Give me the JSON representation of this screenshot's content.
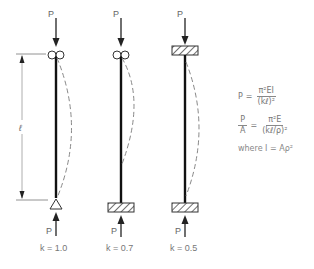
{
  "diagram": {
    "columns": [
      {
        "id": "pinned-pinned",
        "load_top": "P",
        "load_bottom": "P",
        "top_support": "roller",
        "bottom_support": "pin",
        "k_label": "k = 1.0"
      },
      {
        "id": "fixed-pinned",
        "load_top": "P",
        "load_bottom": "P",
        "top_support": "roller",
        "bottom_support": "fixed",
        "k_label": "k = 0.7"
      },
      {
        "id": "fixed-fixed",
        "load_top": "P",
        "load_bottom": "P",
        "top_support": "fixed",
        "bottom_support": "fixed",
        "k_label": "k = 0.5"
      }
    ],
    "length_label": "ℓ",
    "formulas": {
      "f1_lhs": "P",
      "f1_eq": "=",
      "f1_num": "π²EI",
      "f1_den": "(kℓ)²",
      "f2_lhs_num": "P",
      "f2_lhs_den": "A",
      "f2_eq": "=",
      "f2_num": "π²E",
      "f2_den": "(kℓ/ρ)²",
      "where": "where I = Aρ²"
    },
    "colors": {
      "column": "#111111",
      "deflected_shape": "#888888",
      "text": "#666666"
    }
  }
}
